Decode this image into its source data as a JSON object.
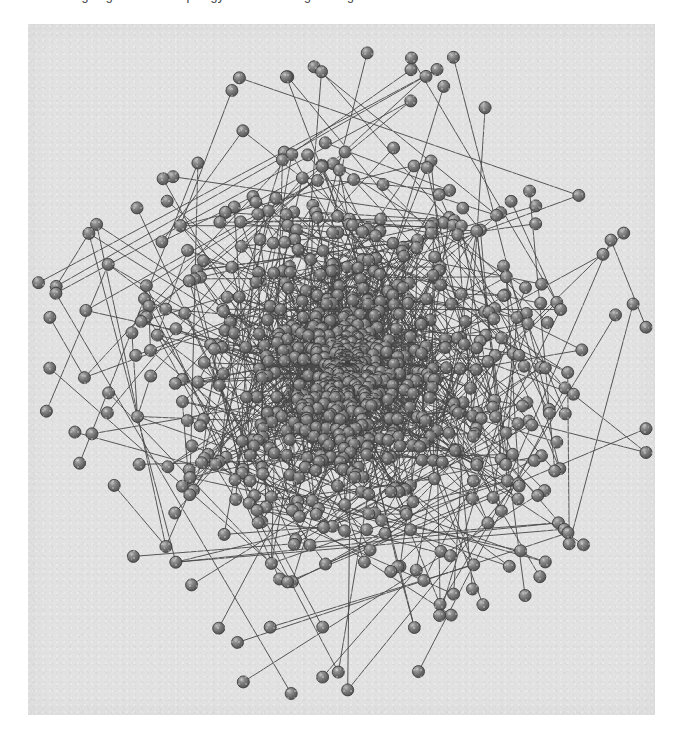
{
  "page": {
    "background_color": "#ffffff",
    "top_caption_partial": "designing a network topology and evaluating routing",
    "caption_clipped": true
  },
  "figure": {
    "panel": {
      "background_color": "#e2e2e2",
      "x": 28,
      "y": 24,
      "width": 627,
      "height": 691,
      "border": "none"
    },
    "title": "",
    "caption": "",
    "axis_labels": [],
    "legend": []
  },
  "chart_data": {
    "type": "scatter",
    "title": "",
    "subtitle": "",
    "xlabel": "",
    "ylabel": "",
    "grid": false,
    "legend_position": "none",
    "rendering": {
      "layout": "force-directed-spring",
      "node_shape": "sphere",
      "node_diameter_px": 12,
      "node_fill_color": "#6e6e6e",
      "node_highlight_color": "#c9c9c9",
      "node_stroke_color": "#3c3c3c",
      "edge_color": "#4a4a4a",
      "edge_width_px": 1,
      "edge_opacity": 0.92,
      "background_color": "#e2e2e2"
    },
    "graph": {
      "node_count": 860,
      "edge_count": 1460,
      "directed": false,
      "core_center_x": 320,
      "core_center_y": 345,
      "core_radius_px": 150,
      "halo_radius_px": 300,
      "degree_distribution": "heavy-tailed / scale-free-like",
      "description": "Dense force-directed 'hairball' layout: a saturated high-degree core of overlapping spheres surrounded by a sparser periphery of low-degree leaf nodes attached by single long edges."
    },
    "seed": 20240917,
    "xlim": [
      0,
      627
    ],
    "ylim": [
      0,
      691
    ],
    "values": [],
    "categories": []
  }
}
